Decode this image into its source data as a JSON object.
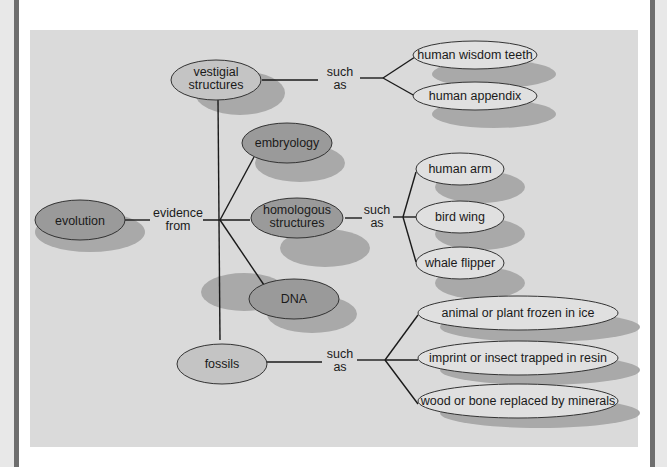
{
  "diagram": {
    "type": "concept-map",
    "colors": {
      "panel_bg": "#dadada",
      "main_node_fill": "#9a9a9a",
      "light_node_fill": "#c4c4c4",
      "leaf_node_fill": "#e0e0e0",
      "shadow": "#a8a8a8",
      "line": "#1a1a1a"
    },
    "root": {
      "label": "evolution"
    },
    "root_link": {
      "label_line1": "evidence",
      "label_line2": "from"
    },
    "evidence": [
      {
        "id": "vestigial",
        "line1": "vestigial",
        "line2": "structures"
      },
      {
        "id": "embryology",
        "line1": "embryology"
      },
      {
        "id": "homologous",
        "line1": "homologous",
        "line2": "structures"
      },
      {
        "id": "dna",
        "line1": "DNA"
      },
      {
        "id": "fossils",
        "line1": "fossils"
      }
    ],
    "links": {
      "vestigial": {
        "line1": "such",
        "line2": "as"
      },
      "homologous": {
        "line1": "such",
        "line2": "as"
      },
      "fossils": {
        "line1": "such",
        "line2": "as"
      }
    },
    "examples": {
      "vestigial": [
        "human wisdom teeth",
        "human appendix"
      ],
      "homologous": [
        "human arm",
        "bird wing",
        "whale flipper"
      ],
      "fossils": [
        "animal or plant frozen in ice",
        "imprint or insect trapped in resin",
        "wood or bone replaced by minerals"
      ]
    }
  }
}
